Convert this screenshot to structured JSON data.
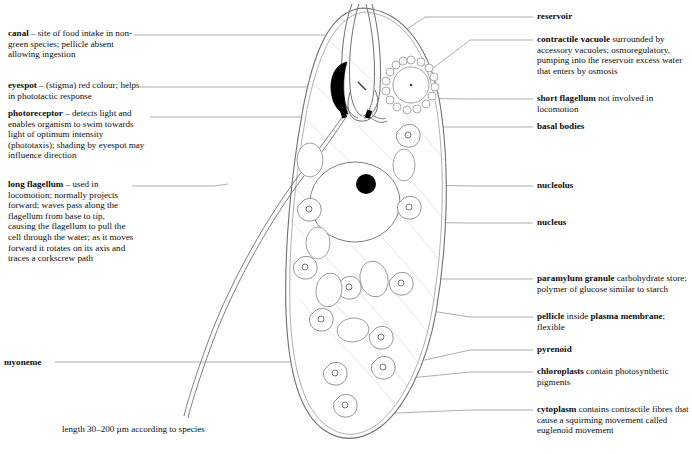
{
  "figure": {
    "caption": "length 30–200 µm according to species",
    "line_color": "#6f6f73",
    "leader_color": "#8a8a8e",
    "ink_color": "#111111",
    "fill_color": "#ffffff"
  },
  "labels_left": [
    {
      "id": "canal",
      "term": "canal",
      "text": " – site of food intake in non-green species; pellicle absent allowing ingestion",
      "lines": [
        "canal – site of food intake in",
        "non-green species; pellicle",
        "absent allowing ingestion"
      ]
    },
    {
      "id": "eyespot",
      "term": "eyespot",
      "text": " – (stigma) red colour; helps in phototactic response",
      "lines": [
        "eyespot – (stigma) red colour;",
        "helps in phototactic response"
      ]
    },
    {
      "id": "photoreceptor",
      "term": "photoreceptor",
      "text": " – detects light and enables organism to swim towards light of optimum intensity (phototaxis); shading by eyespot may influence direction",
      "lines": [
        "photoreceptor – detects light",
        "and enables organism to swim",
        "towards light of optimum",
        "intensity (phototaxis);",
        "shading by eyespot may",
        "influence direction"
      ]
    },
    {
      "id": "long-flagellum",
      "term": "long flagellum",
      "text": " – used in locomotion; normally projects forward; waves pass along the flagellum from base to tip, causing the flagellum to pull the cell through the water; as it moves forward it rotates on its axis and traces a corkscrew path",
      "lines": [
        "long flagellum – used in",
        "locomotion; normally projects",
        "forward; waves pass along the",
        "flagellum from base to tip,",
        "causing the flagellum to pull",
        "the cell through the water; as",
        "it moves forward it rotates on",
        "its axis and traces a",
        "corkscrew path"
      ]
    },
    {
      "id": "myoneme",
      "term": "myoneme",
      "text": "",
      "lines": [
        "myoneme"
      ]
    }
  ],
  "labels_right": [
    {
      "id": "reservoir",
      "term": "reservoir",
      "text": "",
      "lines": [
        "reservoir"
      ]
    },
    {
      "id": "contractile-vacuole",
      "term": "contractile vacuole",
      "text": " surrounded by accessory vacuoles; osmoregulatory, pumping into the reservoir excess water that enters by osmosis",
      "lines": [
        "contractile vacuole surrounded",
        "by accessory vacuoles;",
        "osmoregulatory, pumping into",
        "the reservoir excess water",
        "that enters by osmosis"
      ]
    },
    {
      "id": "short-flagellum",
      "term": "short flagellum",
      "text": " not involved in locomotion",
      "lines": [
        "short flagellum not involved",
        "in locomotion"
      ]
    },
    {
      "id": "basal-bodies",
      "term": "basal bodies",
      "text": "",
      "lines": [
        "basal bodies"
      ]
    },
    {
      "id": "nucleolus",
      "term": "nucleolus",
      "text": "",
      "lines": [
        "nucleolus"
      ]
    },
    {
      "id": "nucleus",
      "term": "nucleus",
      "text": "",
      "lines": [
        "nucleus"
      ]
    },
    {
      "id": "paramylum-granule",
      "term": "paramylum granule",
      "text": " carbohydrate store; polymer of glucose similar to starch",
      "lines": [
        "paramylum granule carbohydrate",
        "store; polymer of glucose",
        "similar to starch"
      ]
    },
    {
      "id": "pellicle",
      "term": "pellicle",
      "text": " inside plasma membrane; flexible",
      "lines": [
        "pellicle inside plasma",
        "membrane; flexible"
      ]
    },
    {
      "id": "pyrenoid",
      "term": "pyrenoid",
      "text": "",
      "lines": [
        "pyrenoid"
      ]
    },
    {
      "id": "chloroplasts",
      "term": "chloroplasts",
      "text": " contain photosynthetic pigments",
      "lines": [
        "chloroplasts contain",
        "photosynthetic pigments"
      ]
    },
    {
      "id": "cytoplasm",
      "term": "cytoplasm",
      "text": " contains contractile fibres that cause a squirming movement called euglenoid movement",
      "lines": [
        "cytoplasm contains contractile",
        "fibres that cause a squirming",
        "movement called euglenoid",
        "movement"
      ]
    }
  ],
  "structures": {
    "cell_outline": "elongated teardrop, rounded anterior, tapered posterior",
    "eyespot_color": "#000000",
    "nucleolus_color": "#000000",
    "basal_body_color": "#000000",
    "accessory_vacuole_count": 16,
    "chloroplast_count": 11,
    "paramylum_count": 6
  }
}
